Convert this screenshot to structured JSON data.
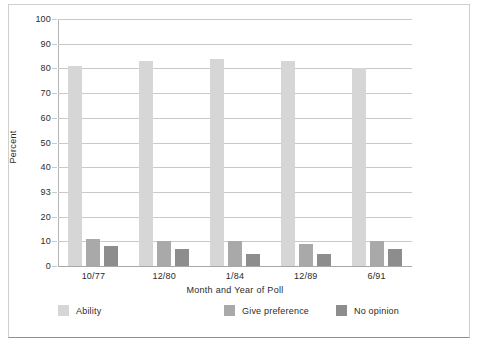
{
  "chart_data": {
    "type": "bar",
    "title": "",
    "xlabel": "Month and Year of Poll",
    "ylabel": "Percent",
    "categories": [
      "10/77",
      "12/80",
      "1/84",
      "12/89",
      "6/91"
    ],
    "series": [
      {
        "name": "Ability",
        "color": "#d6d6d6",
        "values": [
          81,
          83,
          84,
          83,
          80
        ]
      },
      {
        "name": "Give preference",
        "color": "#a9a9a9",
        "values": [
          11,
          10,
          10,
          9,
          10
        ]
      },
      {
        "name": "No opinion",
        "color": "#8d8d8d",
        "values": [
          8,
          7,
          5,
          5,
          7
        ]
      }
    ],
    "ylim": [
      0,
      100
    ],
    "yticks": [
      0,
      10,
      20,
      93,
      40,
      50,
      60,
      70,
      80,
      90,
      100
    ],
    "ytick_values": [
      0,
      10,
      20,
      30,
      40,
      50,
      60,
      70,
      80,
      90,
      100
    ],
    "grid": true,
    "legend_position": "bottom"
  }
}
